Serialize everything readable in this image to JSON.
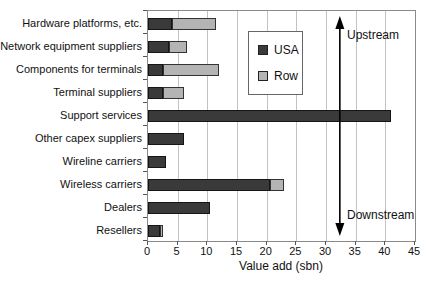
{
  "chart_data": {
    "type": "bar",
    "orientation": "horizontal",
    "stacked": true,
    "title": "",
    "xlabel": "Value add (sbn)",
    "xlim": [
      0,
      45
    ],
    "xticks": [
      0,
      5,
      10,
      15,
      20,
      25,
      30,
      35,
      40,
      45
    ],
    "grid": true,
    "legend_position": "inside-top-center",
    "categories": [
      "Hardware platforms, etc.",
      "Network equipment suppliers",
      "Components for terminals",
      "Terminal suppliers",
      "Support services",
      "Other capex suppliers",
      "Wireline carriers",
      "Wireless carriers",
      "Dealers",
      "Resellers"
    ],
    "series": [
      {
        "name": "USA",
        "color": "#3a3a3a",
        "values": [
          4,
          3.5,
          2.5,
          2.5,
          41,
          6,
          3,
          20.5,
          10.5,
          2
        ]
      },
      {
        "name": "Row",
        "color": "#b4b4b4",
        "values": [
          7.5,
          3,
          9.5,
          3.5,
          0,
          0,
          0,
          2.5,
          0,
          0.5
        ]
      }
    ],
    "annotations": {
      "arrow_x": 32.5,
      "upstream_label": "Upstream",
      "downstream_label": "Downstream"
    }
  }
}
